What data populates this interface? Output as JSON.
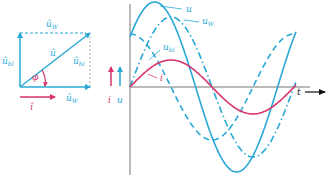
{
  "colors": {
    "voltage": "#29a8d6",
    "current": "#d8356a",
    "axis": "#555555",
    "arrow_t": "#111111"
  },
  "phasor_diagram": {
    "origin": [
      20,
      87
    ],
    "width": 70,
    "height": 54,
    "labels": {
      "u_w_top": "û",
      "u_w_top_sub": "W",
      "u_bl_left": "û",
      "u_bl_left_sub": "bl",
      "u_hat": "û",
      "u_bl_right": "û",
      "u_bl_right_sub": "bl",
      "phi": "φ",
      "u_w_bottom": "û",
      "u_w_bottom_sub": "W",
      "i_hat": "î"
    }
  },
  "legend_arrows": {
    "i_label": "i",
    "u_label": "u"
  },
  "chart_data": {
    "type": "line",
    "title": "",
    "xlabel": "t",
    "ylabel": "i u",
    "x_origin_px": 130,
    "y_axis_px": 87,
    "period_px": 164,
    "x_end_px": 296,
    "series": [
      {
        "name": "u",
        "amplitude_px": 85,
        "phase_deg": 36,
        "style": "solid",
        "color": "#29a8d6"
      },
      {
        "name": "uW",
        "amplitude_px": 70,
        "phase_deg": 0,
        "style": "dashdot",
        "color": "#29a8d6"
      },
      {
        "name": "ubl",
        "amplitude_px": 53,
        "phase_deg": 90,
        "style": "dashed",
        "color": "#29a8d6"
      },
      {
        "name": "i",
        "amplitude_px": 27,
        "phase_deg": 0,
        "style": "solid",
        "color": "#d8356a"
      }
    ],
    "curve_labels": [
      {
        "text": "u",
        "sub": "",
        "x": 186,
        "y": 12,
        "lx1": 160,
        "ly1": 6,
        "lx2": 182,
        "ly2": 9
      },
      {
        "text": "u",
        "sub": "W",
        "x": 202,
        "y": 24,
        "lx1": 184,
        "ly1": 20,
        "lx2": 199,
        "ly2": 22
      },
      {
        "text": "u",
        "sub": "bl",
        "x": 163,
        "y": 50,
        "lx1": 149,
        "ly1": 60,
        "lx2": 160,
        "ly2": 50
      },
      {
        "text": "i",
        "sub": "",
        "x": 160,
        "y": 81,
        "lx1": 148,
        "ly1": 74,
        "lx2": 157,
        "ly2": 78
      }
    ]
  }
}
